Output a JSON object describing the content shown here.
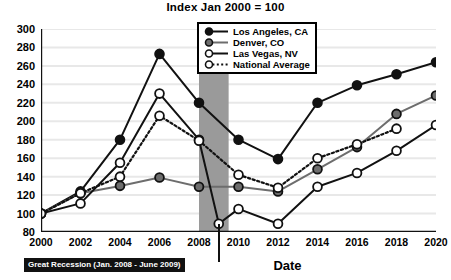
{
  "chart_data": {
    "type": "line",
    "title": "Index Jan 2000 = 100",
    "xlabel": "Date",
    "ylabel": "",
    "xlim": [
      2000,
      2020
    ],
    "ylim": [
      80,
      300
    ],
    "ytick_step": 20,
    "xtick_step": 2,
    "grid": true,
    "legend_position": "top-center",
    "x": [
      2000,
      2002,
      2004,
      2006,
      2008,
      2010,
      2012,
      2014,
      2016,
      2018,
      2020
    ],
    "xticklabels": [
      "2000",
      "2002",
      "2004",
      "2006",
      "2008",
      "2010",
      "2012",
      "2014",
      "2016",
      "2018",
      "2020"
    ],
    "yticklabels": [
      "80",
      "100",
      "120",
      "140",
      "160",
      "180",
      "200",
      "220",
      "240",
      "260",
      "280",
      "300"
    ],
    "series": [
      {
        "name": "Los Angeles, CA",
        "marker": "filled-circle",
        "color": "#111111",
        "line": "solid",
        "values": [
          100,
          124,
          180,
          273,
          220,
          180,
          159,
          220,
          239,
          251,
          264
        ]
      },
      {
        "name": "Denver, CO",
        "marker": "gray-circle",
        "color": "#6d6d6d",
        "line": "solid",
        "values": [
          100,
          122,
          130,
          139,
          129,
          129,
          124,
          148,
          172,
          208,
          228
        ]
      },
      {
        "name": "Las Vegas, NV",
        "marker": "open-circle",
        "color": "#111111",
        "line": "solid",
        "values": [
          100,
          111,
          155,
          230,
          180,
          105,
          89,
          129,
          144,
          168,
          196
        ]
      },
      {
        "name": "National Average",
        "marker": "open-circle",
        "color": "#111111",
        "line": "dotted",
        "values": [
          100,
          122,
          140,
          206,
          179,
          142,
          128,
          160,
          175,
          192,
          null
        ]
      }
    ],
    "extra_points": [
      {
        "series": "Las Vegas, NV",
        "x": 2009,
        "y": 89,
        "note": "mid-2009 trough marker"
      }
    ],
    "annotations": [
      {
        "name": "great-recession",
        "label": "Great Recession (Jan. 2008 - June 2009)",
        "band_start": 2008,
        "band_end": 2009.5,
        "band_color": "#9a9a9a"
      }
    ]
  },
  "colors": {
    "background": "#ffffff",
    "axis": "#111111",
    "grid": "#e8e8e8",
    "recession_band": "#9a9a9a",
    "callout_bg": "#111111",
    "callout_text": "#ffffff",
    "denver_marker": "#6d6d6d"
  }
}
